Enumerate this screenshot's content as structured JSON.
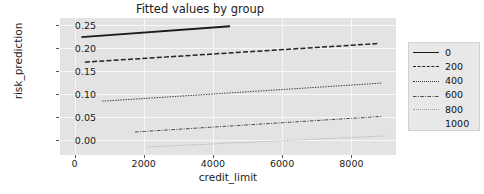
{
  "chart_data": {
    "type": "line",
    "title": "Fitted values by group",
    "xlabel": "credit_limit",
    "ylabel": "risk_prediction",
    "xlim": [
      -420,
      9300
    ],
    "ylim": [
      -0.032,
      0.266
    ],
    "xticks": [
      0,
      2000,
      4000,
      6000,
      8000
    ],
    "xtick_labels": [
      "0",
      "2000",
      "4000",
      "6000",
      "8000"
    ],
    "yticks": [
      0.0,
      0.05,
      0.1,
      0.15,
      0.2,
      0.25
    ],
    "ytick_labels": [
      "0.00",
      "0.05",
      "0.10",
      "0.15",
      "0.20",
      "0.25"
    ],
    "grid": true,
    "legend_position": "right",
    "legend_title": "",
    "series": [
      {
        "name": "0",
        "style": "solid",
        "color": "#1b1b1b",
        "width": 1.9,
        "x": [
          200,
          4500
        ],
        "y": [
          0.2245,
          0.248
        ]
      },
      {
        "name": "200",
        "style": "dashed",
        "color": "#232323",
        "width": 1.5,
        "x": [
          300,
          8800
        ],
        "y": [
          0.17,
          0.2105
        ]
      },
      {
        "name": "400",
        "style": "dotted",
        "color": "#3b3b3b",
        "width": 1.0,
        "x": [
          800,
          8900
        ],
        "y": [
          0.085,
          0.1245
        ]
      },
      {
        "name": "600",
        "style": "dashdot",
        "color": "#4a4a4a",
        "width": 1.0,
        "x": [
          1750,
          8900
        ],
        "y": [
          0.018,
          0.052
        ]
      },
      {
        "name": "800",
        "style": "dotted-fine",
        "color": "#9a9a9a",
        "width": 0.8,
        "x": [
          2100,
          9000
        ],
        "y": [
          -0.0145,
          0.0095
        ]
      },
      {
        "name": "1000",
        "style": "none",
        "color": "#ffffff",
        "width": 0.8,
        "x": [],
        "y": []
      }
    ]
  },
  "chart": {
    "title": "Fitted values by group",
    "xlabel": "credit_limit",
    "ylabel": "risk_prediction"
  },
  "axes": {
    "y_tick_0": "0.25",
    "y_tick_1": "0.20",
    "y_tick_2": "0.15",
    "y_tick_3": "0.10",
    "y_tick_4": "0.05",
    "y_tick_5": "0.00",
    "x_tick_0": "0",
    "x_tick_1": "2000",
    "x_tick_2": "4000",
    "x_tick_3": "6000",
    "x_tick_4": "8000"
  },
  "legend": {
    "entries": [
      {
        "label": "0"
      },
      {
        "label": "200"
      },
      {
        "label": "400"
      },
      {
        "label": "600"
      },
      {
        "label": "800"
      },
      {
        "label": "1000"
      }
    ]
  },
  "colors": {
    "plot_background": "#e3e3e3",
    "figure_background": "#ffffff",
    "grid": "#f7f7f7",
    "text": "#1a1a1a",
    "legend_background": "#e8e8e8"
  }
}
